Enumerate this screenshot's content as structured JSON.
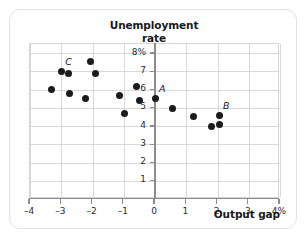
{
  "chart_data": {
    "type": "scatter",
    "title": "Unemployment rate",
    "title_line1": "Unemployment",
    "title_line2": "rate",
    "xlabel": "Output gap",
    "ylabel": "Unemployment rate",
    "xlim": [
      -4,
      4
    ],
    "ylim": [
      0,
      8.5
    ],
    "grid": true,
    "legend": null,
    "x_ticks": [
      -4,
      -3,
      -2,
      -1,
      0,
      1,
      2,
      3,
      4
    ],
    "x_tick_labels": [
      "–4",
      "–3",
      "–2",
      "–1",
      "0",
      "1",
      "2",
      "3",
      "4%"
    ],
    "y_ticks": [
      1,
      2,
      3,
      4,
      5,
      6,
      7,
      8
    ],
    "y_tick_labels": [
      "1",
      "2",
      "3",
      "4",
      "5",
      "6",
      "7",
      "8%"
    ],
    "point_color": "#1b1b1d",
    "grid_color": "#d9d9d9",
    "axis_color": "#8c8c8c",
    "points": [
      {
        "x": -3.32,
        "y": 6.0,
        "label": ""
      },
      {
        "x": -3.0,
        "y": 7.0,
        "label": "C"
      },
      {
        "x": -2.76,
        "y": 6.88,
        "label": ""
      },
      {
        "x": -2.74,
        "y": 5.76,
        "label": ""
      },
      {
        "x": -2.24,
        "y": 5.5,
        "label": ""
      },
      {
        "x": -2.05,
        "y": 7.55,
        "label": ""
      },
      {
        "x": -1.9,
        "y": 6.9,
        "label": ""
      },
      {
        "x": -1.14,
        "y": 5.7,
        "label": ""
      },
      {
        "x": -0.98,
        "y": 4.7,
        "label": ""
      },
      {
        "x": -0.6,
        "y": 6.15,
        "label": ""
      },
      {
        "x": -0.5,
        "y": 5.4,
        "label": ""
      },
      {
        "x": 0.0,
        "y": 5.52,
        "label": "A"
      },
      {
        "x": 0.55,
        "y": 4.95,
        "label": ""
      },
      {
        "x": 1.24,
        "y": 4.5,
        "label": ""
      },
      {
        "x": 1.8,
        "y": 3.95,
        "label": ""
      },
      {
        "x": 2.05,
        "y": 4.58,
        "label": "B"
      },
      {
        "x": 2.06,
        "y": 4.1,
        "label": ""
      }
    ],
    "annotations": [
      {
        "text": "A",
        "x": 0.0,
        "y": 5.52
      },
      {
        "text": "B",
        "x": 2.05,
        "y": 4.58
      },
      {
        "text": "C",
        "x": -3.0,
        "y": 7.0
      }
    ]
  }
}
